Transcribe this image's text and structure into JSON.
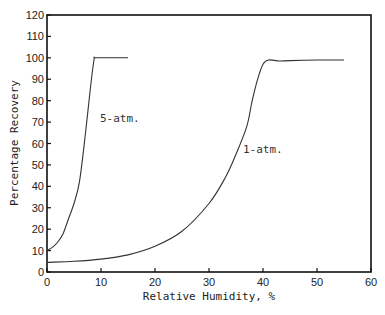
{
  "chart_data": {
    "type": "line",
    "title": "",
    "xlabel": "Relative Humidity, %",
    "ylabel": "Percentage Recovery",
    "xlim": [
      0,
      60
    ],
    "ylim": [
      0,
      120
    ],
    "xticks": [
      0,
      10,
      20,
      30,
      40,
      50,
      60
    ],
    "yticks": [
      0,
      10,
      20,
      30,
      40,
      50,
      60,
      70,
      80,
      90,
      100,
      110,
      120
    ],
    "grid": false,
    "legend": "none (curves labeled inline)",
    "series": [
      {
        "name": "5-atm.",
        "x": [
          0,
          1,
          2,
          3,
          4,
          5,
          6,
          7,
          8,
          8.7,
          9,
          12,
          15
        ],
        "values": [
          10,
          11.5,
          14,
          18,
          25,
          32,
          42,
          62,
          85,
          99,
          100,
          100,
          100
        ]
      },
      {
        "name": "1-atm.",
        "x": [
          0,
          5,
          10,
          15,
          20,
          25,
          30,
          33,
          35,
          37,
          38,
          39,
          40,
          41,
          43,
          45,
          50,
          55
        ],
        "values": [
          4.5,
          5,
          6,
          8,
          12,
          19,
          32,
          44,
          55,
          68,
          80,
          90,
          97,
          99,
          98.5,
          98.7,
          99,
          99
        ]
      }
    ],
    "annotations": [
      {
        "text": "5-atm.",
        "x": 9.5,
        "y": 72
      },
      {
        "text": "1-atm.",
        "x": 38,
        "y": 57
      }
    ]
  },
  "labels": {
    "xlabel": "Relative Humidity, %",
    "ylabel": "Percentage Recovery",
    "annot_5atm": "5-atm.",
    "annot_1atm": "1-atm."
  }
}
